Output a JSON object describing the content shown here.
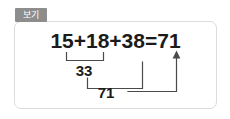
{
  "tab": {
    "label": "보기"
  },
  "equation": {
    "text": "15+18+38=71",
    "terms": [
      "15",
      "18",
      "38"
    ],
    "result": "71",
    "operator": "+",
    "equals": "="
  },
  "steps": [
    {
      "name": "first-partial-sum",
      "covers": [
        "15",
        "18"
      ],
      "value": "33"
    },
    {
      "name": "second-partial-sum",
      "covers": [
        "33",
        "38"
      ],
      "value": "71"
    }
  ],
  "arrow": {
    "name": "arrow-to-result",
    "points_to": "71",
    "direction": "up"
  },
  "colors": {
    "tab_background": "#8d8d8d",
    "tab_text": "#ffffff",
    "frame_border": "#dcdcdc",
    "ink": "#1b1b1b",
    "connector": "#4a4a4a",
    "page_background": "#ffffff"
  }
}
